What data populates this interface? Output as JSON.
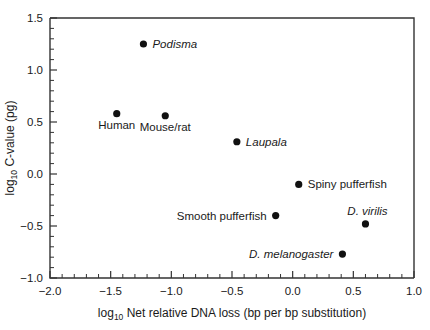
{
  "chart_data": {
    "type": "scatter",
    "title": "",
    "xlabel": "log10 Net relative DNA loss (bp per bp substitution)",
    "ylabel": "log10 C-value (pg)",
    "xlabel_parts": {
      "prefix": "log",
      "sub": "10",
      "rest": " Net relative DNA loss (bp per bp substitution)"
    },
    "ylabel_parts": {
      "prefix": "log",
      "sub": "10",
      "rest": " C-value (pg)"
    },
    "xlim": [
      -2.0,
      1.0
    ],
    "ylim": [
      -1.0,
      1.5
    ],
    "x_ticks": [
      -2.0,
      -1.5,
      -1.0,
      -0.5,
      0.0,
      0.5,
      1.0
    ],
    "x_tick_labels": [
      "-2.0",
      "-1.5",
      "-1.0",
      "-0.5",
      "0.0",
      "0.5",
      "1.0"
    ],
    "y_ticks": [
      -1.0,
      -0.5,
      0.0,
      0.5,
      1.0,
      1.5
    ],
    "y_tick_labels": [
      "-1.0",
      "-0.5",
      "0.0",
      "0.5",
      "1.0",
      "1.5"
    ],
    "x_minor_step": 0.1,
    "y_minor_step": 0.1,
    "grid": false,
    "legend": "none",
    "marker_color": "#111111",
    "axis_color": "#333333",
    "points": [
      {
        "label": "Podisma",
        "x": -1.23,
        "y": 1.25,
        "italic": true,
        "label_side": "right"
      },
      {
        "label": "Human",
        "x": -1.45,
        "y": 0.58,
        "italic": false,
        "label_side": "below"
      },
      {
        "label": "Mouse/rat",
        "x": -1.05,
        "y": 0.56,
        "italic": false,
        "label_side": "below"
      },
      {
        "label": "Laupala",
        "x": -0.46,
        "y": 0.31,
        "italic": true,
        "label_side": "right"
      },
      {
        "label": "Spiny pufferfish",
        "x": 0.05,
        "y": -0.1,
        "italic": false,
        "label_side": "right"
      },
      {
        "label": "Smooth pufferfish",
        "x": -0.14,
        "y": -0.4,
        "italic": false,
        "label_side": "left"
      },
      {
        "label": "D. virilis",
        "x": 0.6,
        "y": -0.48,
        "italic": true,
        "label_side": "above"
      },
      {
        "label": "D. melanogaster",
        "x": 0.41,
        "y": -0.77,
        "italic": true,
        "label_side": "left"
      }
    ]
  }
}
